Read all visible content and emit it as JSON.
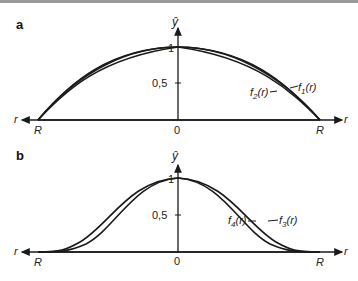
{
  "panels": [
    {
      "label": "a",
      "y_axis_label": "ŷ",
      "x_axis_label": "r",
      "ticks": {
        "y_one": "1",
        "y_half": "0,5",
        "origin": "0",
        "left": "R",
        "right": "R"
      },
      "curves": [
        {
          "name": "f1",
          "label_main": "f",
          "label_sub": "1",
          "label_arg": "(r)"
        },
        {
          "name": "f2",
          "label_main": "f",
          "label_sub": "2",
          "label_arg": "(r)"
        }
      ]
    },
    {
      "label": "b",
      "y_axis_label": "ŷ",
      "x_axis_label": "r",
      "ticks": {
        "y_one": "1",
        "y_half": "0,5",
        "origin": "0",
        "left": "R",
        "right": "R"
      },
      "curves": [
        {
          "name": "f3",
          "label_main": "f",
          "label_sub": "3",
          "label_arg": "(r)"
        },
        {
          "name": "f4",
          "label_main": "f",
          "label_sub": "4",
          "label_arg": "(r)"
        }
      ]
    }
  ],
  "colors": {
    "line": "#1a1a1a",
    "text": "#222222",
    "background": "#ffffff"
  }
}
